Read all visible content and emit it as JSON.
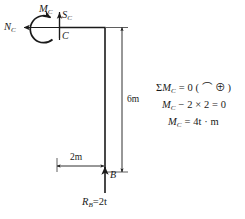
{
  "figure": {
    "type": "free-body-diagram",
    "stroke_color": "#1a1a1a",
    "background_color": "#ffffff"
  },
  "structure": {
    "members": [
      {
        "name": "horizontal-member",
        "from": "C",
        "to": "corner"
      },
      {
        "name": "vertical-member",
        "from": "corner",
        "to": "B"
      }
    ],
    "nodes": [
      {
        "name": "C",
        "label": "C"
      },
      {
        "name": "B",
        "label": "B"
      }
    ]
  },
  "internal_forces": {
    "axial": {
      "symbol": "N",
      "subscript": "C",
      "direction": "left"
    },
    "shear": {
      "symbol": "S",
      "subscript": "C",
      "direction": "up"
    },
    "moment": {
      "symbol": "M",
      "subscript": "C",
      "direction": "counterclockwise"
    }
  },
  "reactions": {
    "support_B": {
      "symbol": "R",
      "subscript": "B",
      "equals": "=2t",
      "direction": "up"
    }
  },
  "dimensions": [
    {
      "name": "vertical-dimension",
      "value": "6m",
      "orientation": "vertical"
    },
    {
      "name": "horizontal-dimension",
      "value": "2m",
      "orientation": "horizontal"
    }
  ],
  "equations": {
    "line1": {
      "sum": "Σ",
      "symbol": "M",
      "subscript": "C",
      "rest": " = 0 ( ⌒ ⊕ )"
    },
    "line2": {
      "symbol": "M",
      "subscript": "C",
      "rest": " − 2 × 2 = 0"
    },
    "line3": {
      "symbol": "M",
      "subscript": "C",
      "rest": " = 4t · m"
    }
  }
}
